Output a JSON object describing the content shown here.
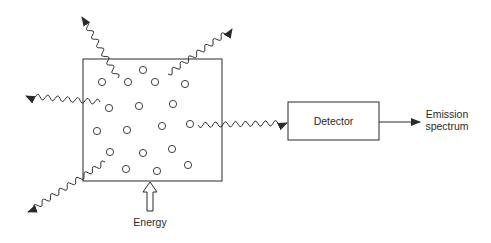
{
  "diagram": {
    "type": "emission-spectroscopy-schematic",
    "sample_box": {
      "x": 83,
      "y": 59,
      "w": 139,
      "h": 122
    },
    "particles": [
      [
        143,
        70
      ],
      [
        102,
        82
      ],
      [
        128,
        82
      ],
      [
        155,
        82
      ],
      [
        185,
        84
      ],
      [
        109,
        108
      ],
      [
        139,
        106
      ],
      [
        173,
        104
      ],
      [
        97,
        131
      ],
      [
        127,
        130
      ],
      [
        162,
        126
      ],
      [
        190,
        124
      ],
      [
        110,
        152
      ],
      [
        143,
        153
      ],
      [
        172,
        149
      ],
      [
        126,
        169
      ],
      [
        157,
        171
      ],
      [
        188,
        165
      ]
    ],
    "energy": {
      "label": "Energy"
    },
    "detector": {
      "label": "Detector",
      "x": 288,
      "y": 102,
      "w": 91,
      "h": 38
    },
    "output": {
      "line1": "Emission",
      "line2": "spectrum"
    },
    "emissions": [
      {
        "name": "emission-top-left",
        "from": [
          118,
          78
        ],
        "to": [
          82,
          17
        ]
      },
      {
        "name": "emission-top-right",
        "from": [
          168,
          74
        ],
        "to": [
          232,
          29
        ]
      },
      {
        "name": "emission-left",
        "from": [
          100,
          102
        ],
        "to": [
          26,
          96
        ]
      },
      {
        "name": "emission-bottom-left",
        "from": [
          105,
          162
        ],
        "to": [
          28,
          212
        ]
      },
      {
        "name": "emission-right-to-detector",
        "from": [
          198,
          125
        ],
        "to": [
          287,
          123
        ]
      }
    ],
    "colors": {
      "line": "#2a2a2a",
      "background": "#ffffff"
    }
  }
}
